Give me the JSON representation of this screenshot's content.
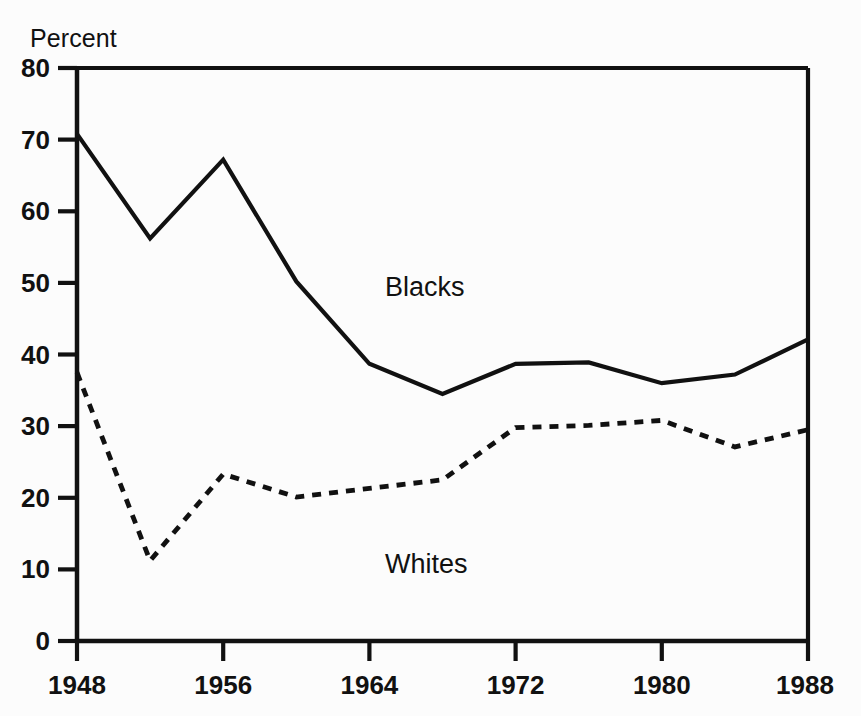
{
  "chart_data": {
    "type": "line",
    "title": "",
    "subtitle": "",
    "xlabel": "",
    "ylabel": "Percent",
    "ylabel_position": "top-left",
    "xlim": [
      1948,
      1988
    ],
    "ylim": [
      0,
      80
    ],
    "grid": false,
    "legend": "inline-annotations",
    "x": [
      1948,
      1952,
      1956,
      1960,
      1964,
      1968,
      1972,
      1976,
      1980,
      1984,
      1988
    ],
    "xticks": [
      1948,
      1956,
      1964,
      1972,
      1980,
      1988
    ],
    "xtick_labels": [
      "1948",
      "1956",
      "1964",
      "1972",
      "1980",
      "1988"
    ],
    "yticks": [
      0,
      10,
      20,
      30,
      40,
      50,
      60,
      70,
      80
    ],
    "ytick_labels": [
      "0",
      "10",
      "20",
      "30",
      "40",
      "50",
      "60",
      "70",
      "80"
    ],
    "series": [
      {
        "name": "Blacks",
        "style": "solid",
        "color": "#111111",
        "line_width": 4.2,
        "values": [
          70.8,
          56.2,
          67.2,
          50.2,
          38.7,
          34.5,
          38.7,
          38.9,
          36.0,
          37.2,
          42.1
        ],
        "label_text": "Blacks",
        "label_x": 1965,
        "label_y": 51
      },
      {
        "name": "Whites",
        "style": "dashed",
        "color": "#111111",
        "line_width": 4.8,
        "dash_pattern": "9 8",
        "values": [
          37.5,
          11.2,
          23.3,
          20.1,
          21.3,
          22.5,
          29.8,
          30.1,
          30.8,
          27.1,
          29.5
        ],
        "label_text": "Whites",
        "label_x": 1965,
        "label_y": 13
      }
    ]
  },
  "axes": {
    "y_axis_title": "Percent",
    "y_tick_labels": [
      "80",
      "70",
      "60",
      "50",
      "40",
      "30",
      "20",
      "10",
      "0"
    ],
    "x_tick_labels": [
      "1948",
      "1956",
      "1964",
      "1972",
      "1980",
      "1988"
    ]
  },
  "annotations": {
    "blacks": "Blacks",
    "whites": "Whites"
  },
  "colors": {
    "background": "#fcfcfc",
    "ink": "#111111",
    "axis": "#111111"
  }
}
